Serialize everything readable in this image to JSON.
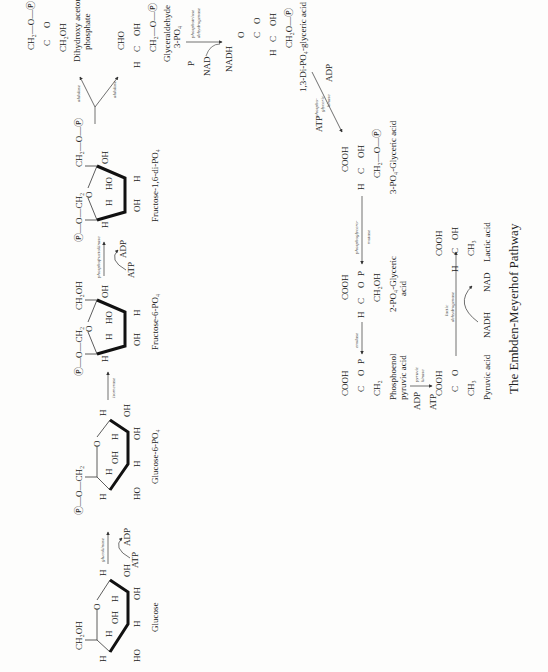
{
  "figure": {
    "title": "The Embden-Meyerhof Pathway",
    "orientation": "rotated 90° counterclockwise"
  },
  "compounds": {
    "glucose": "Glucose",
    "glucose6p": "Glucose-6-PO₄",
    "fructose6p": "Fructose-6-PO₄",
    "fructose16dp": "Fructose-1,6-di-PO₄",
    "dhap_1": "Dihydroxy acetone",
    "dhap_2": "phosphate",
    "g3p_1": "Glyceraldehyde",
    "g3p_2": "3-PO₄",
    "dpg13": "1,3-Di-PO₄-glyceric acid",
    "pg3": "3-PO₄-Glyceric acid",
    "pg2_1": "2-PO₄-Glyceric",
    "pg2_2": "acid",
    "pep_1": "Phosphoenol",
    "pep_2": "pyruvic acid",
    "pyruvic": "Pyruvic acid",
    "lactic": "Lactic acid"
  },
  "enzymes": {
    "glucokinase": "glucokinase",
    "isomerase": "isomerase",
    "phosphofructokinase": "phosphofructokinase",
    "aldolase_top": "aldolase",
    "aldolase_bottom": "aldolase",
    "triose_dh_1": "phosphotriose",
    "triose_dh_2": "dehydrogenase",
    "pgk_1": "phospho-",
    "pgk_2": "glyceric",
    "pgk_3": "kinase",
    "mutase_1": "phosphoglycero-",
    "mutase_2": "mutase",
    "enolase": "enolase",
    "pyruvic_kinase_1": "pyruvic",
    "pyruvic_kinase_2": "kinase",
    "ldh_1": "lactic",
    "ldh_2": "dehydrogenase"
  },
  "cofactors": {
    "atp": "ATP",
    "adp": "ADP",
    "nad": "NAD",
    "nadh": "NADH",
    "p": "P"
  },
  "groups": {
    "ch2oh": "CH₂OH",
    "ch2": "CH₂",
    "o": "O",
    "h": "H",
    "oh": "OH",
    "ho": "HO",
    "cooh": "COOH",
    "cho": "CHO",
    "c": "C",
    "ch3": "CH₃",
    "p_o_ch2": "Ⓟ—O—CH₂",
    "ch2_o_p": "CH₂—O—Ⓟ",
    "ch2o_p": "CH₂O—Ⓟ"
  }
}
